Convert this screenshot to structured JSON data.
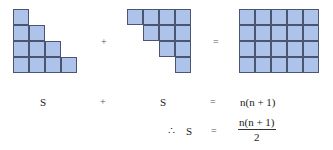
{
  "diagram": {
    "colors": {
      "cell_fill": "#aec3ea",
      "cell_border": "#4a5670"
    },
    "shapes": [
      {
        "name": "staircase-left",
        "origin": [
          13,
          9
        ],
        "cell": 16,
        "cells": [
          [
            0,
            0
          ],
          [
            0,
            1
          ],
          [
            1,
            1
          ],
          [
            0,
            2
          ],
          [
            1,
            2
          ],
          [
            2,
            2
          ],
          [
            0,
            3
          ],
          [
            1,
            3
          ],
          [
            2,
            3
          ],
          [
            3,
            3
          ]
        ]
      },
      {
        "name": "staircase-right-inverted",
        "origin": [
          127,
          9
        ],
        "cell": 16,
        "cells": [
          [
            0,
            0
          ],
          [
            1,
            0
          ],
          [
            2,
            0
          ],
          [
            3,
            0
          ],
          [
            1,
            1
          ],
          [
            2,
            1
          ],
          [
            3,
            1
          ],
          [
            2,
            2
          ],
          [
            3,
            2
          ],
          [
            3,
            3
          ]
        ]
      },
      {
        "name": "rectangle",
        "origin": [
          239,
          9
        ],
        "cell": 16,
        "cols": 5,
        "rows": 4
      }
    ],
    "top_operators": {
      "plus": "+",
      "equals": "="
    },
    "row1": {
      "left": "S",
      "plus": "+",
      "middle": "S",
      "equals": "=",
      "right": "n(n + 1)"
    },
    "row2": {
      "therefore": "∴",
      "s": "S",
      "equals": "=",
      "numerator": "n(n + 1)",
      "denominator": "2"
    }
  }
}
